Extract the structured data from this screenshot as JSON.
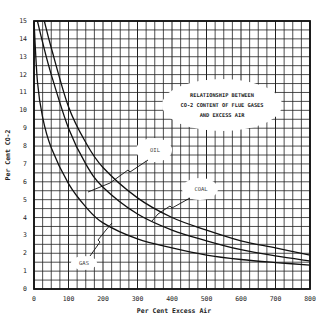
{
  "chart_data": {
    "type": "line",
    "title": "RELATIONSHIP BETWEEN CO-2 CONTENT OF FLUE GASES AND EXCESS AIR",
    "title_lines": [
      "RELATIONSHIP BETWEEN",
      "CO-2 CONTENT OF FLUE GASES",
      "AND EXCESS AIR"
    ],
    "xlabel": "Per Cent Excess Air",
    "ylabel": "Per Cent CO-2",
    "xlim": [
      0,
      800
    ],
    "ylim": [
      0,
      15
    ],
    "x_ticks": [
      0,
      100,
      200,
      300,
      400,
      500,
      600,
      700,
      800
    ],
    "y_ticks": [
      0,
      1,
      2,
      3,
      4,
      5,
      6,
      7,
      8,
      9,
      10,
      11,
      12,
      13,
      14,
      15
    ],
    "grid": true,
    "legend": "inline callout labels",
    "series": [
      {
        "name": "COAL",
        "x": [
          30,
          50,
          100,
          150,
          200,
          300,
          400,
          500,
          600,
          700,
          800
        ],
        "values": [
          15.0,
          13.5,
          10.2,
          8.2,
          6.8,
          5.1,
          4.0,
          3.3,
          2.7,
          2.3,
          1.9
        ]
      },
      {
        "name": "OIL",
        "x": [
          10,
          25,
          50,
          100,
          150,
          200,
          300,
          400,
          500,
          600,
          700,
          800
        ],
        "values": [
          15.0,
          13.8,
          12.0,
          9.0,
          7.0,
          5.7,
          4.2,
          3.3,
          2.7,
          2.2,
          1.85,
          1.57
        ]
      },
      {
        "name": "GAS",
        "x": [
          0,
          10,
          25,
          50,
          100,
          150,
          200,
          300,
          400,
          500,
          600,
          700,
          800
        ],
        "values": [
          15.0,
          11.6,
          9.6,
          7.9,
          5.9,
          4.6,
          3.7,
          2.8,
          2.3,
          1.9,
          1.65,
          1.48,
          1.34
        ]
      }
    ],
    "annotations": [
      {
        "text": "OIL",
        "x": 350,
        "y": 8.0
      },
      {
        "text": "COAL",
        "x": 535,
        "y": 5.7
      },
      {
        "text": "GAS",
        "x": 170,
        "y": 1.6
      }
    ]
  },
  "labels": {
    "title1": "RELATIONSHIP BETWEEN",
    "title2": "CO-2 CONTENT OF FLUE GASES",
    "title3": "AND EXCESS AIR",
    "xlabel": "Per Cent Excess Air",
    "ylabel": "Per Cent CO-2",
    "oil": "OIL",
    "coal": "COAL",
    "gas": "GAS"
  }
}
